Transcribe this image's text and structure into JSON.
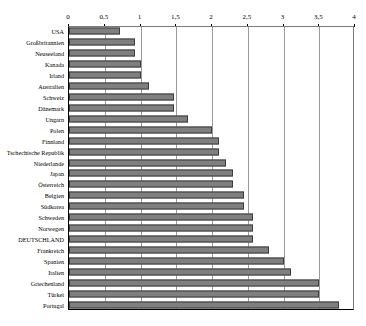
{
  "chart_data": {
    "type": "bar",
    "orientation": "horizontal",
    "title": "",
    "xlabel": "",
    "ylabel": "",
    "xlim": [
      0,
      4
    ],
    "grid": true,
    "legend": false,
    "decimal_separator": ",",
    "tick_labels": [
      "0",
      "0,5",
      "1",
      "1,5",
      "2",
      "2,5",
      "3",
      "3,5",
      "4"
    ],
    "tick_values": [
      0,
      0.5,
      1,
      1.5,
      2,
      2.5,
      3,
      3.5,
      4
    ],
    "categories": [
      "USA",
      "Großbritannien",
      "Neuseeland",
      "Kanada",
      "Irland",
      "Australien",
      "Schweiz",
      "Dänemark",
      "Ungarn",
      "Polen",
      "Finnland",
      "Tschechische Republik",
      "Niederlande",
      "Japan",
      "Österreich",
      "Belgien",
      "Südkorea",
      "Schweden",
      "Norwegen",
      "DEUTSCHLAND",
      "Frankreich",
      "Spanien",
      "Italien",
      "Griechenland",
      "Türkei",
      "Portugal"
    ],
    "values": [
      0.72,
      0.93,
      0.93,
      1.0,
      1.0,
      1.12,
      1.47,
      1.47,
      1.66,
      2.0,
      2.1,
      2.1,
      2.2,
      2.3,
      2.3,
      2.45,
      2.45,
      2.58,
      2.58,
      2.58,
      2.8,
      3.0,
      3.1,
      3.5,
      3.5,
      3.77
    ],
    "highlighted_category": "DEUTSCHLAND",
    "colors": {
      "bar_fill": "#7f7f7f",
      "bar_border": "#3d3d3d",
      "gridline": "#9a9a9a",
      "axis": "#000000",
      "background": "#ffffff"
    }
  }
}
